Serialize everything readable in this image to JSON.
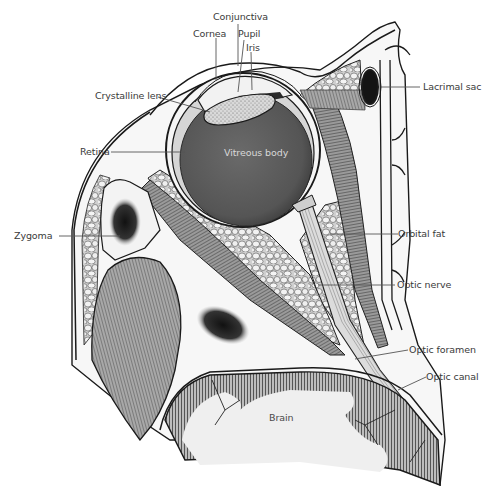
{
  "diagram": {
    "colors": {
      "outline": "#1a1a1a",
      "vitreous": "#5a5a5a",
      "muscle": "#7a7a7a",
      "fat": "#e6e6e6",
      "bone_marrow": "#222222",
      "brain": "#f0f0f0",
      "label_text": "#3a3a3a",
      "leader_line": "#555555"
    },
    "labels": {
      "conjunctiva": "Conjunctiva",
      "cornea": "Cornea",
      "pupil": "Pupil",
      "iris": "Iris",
      "crystalline_lens": "Crystalline lens",
      "lacrimal_sac": "Lacrimal sac",
      "retina": "Retina",
      "vitreous_body": "Vitreous body",
      "zygoma": "Zygoma",
      "orbital_fat": "Orbital fat",
      "optic_nerve": "Optic nerve",
      "optic_foramen": "Optic foramen",
      "optic_canal": "Optic canal",
      "brain": "Brain"
    }
  }
}
